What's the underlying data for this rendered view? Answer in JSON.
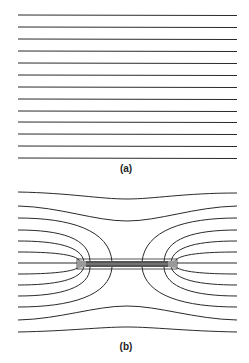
{
  "figure": {
    "panel_a": {
      "label": "(a)",
      "description": "Uniform field: parallel horizontal lines",
      "line_count": 13
    },
    "panel_b": {
      "label": "(b)",
      "description": "Field lines distorted around a thin horizontal bar",
      "line_count": 13
    },
    "colors": {
      "line": "#2a2a2a",
      "bar": "#555555",
      "background": "#ffffff"
    }
  }
}
